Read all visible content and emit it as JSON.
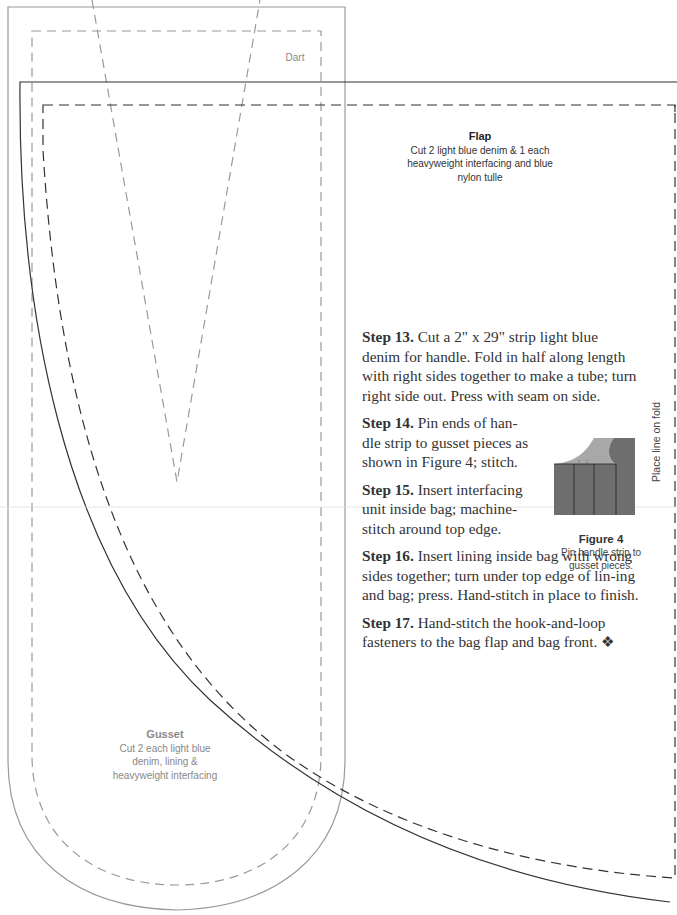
{
  "pattern": {
    "dart": {
      "label": "Dart"
    },
    "flap": {
      "title": "Flap",
      "instructions": [
        "Cut 2 light blue denim & 1 each",
        "heavyweight interfacing and blue",
        "nylon tulle"
      ]
    },
    "gusset": {
      "title": "Gusset",
      "instructions": [
        "Cut 2 each light blue",
        "denim, lining &",
        "heavyweight interfacing"
      ]
    },
    "fold_line": {
      "label": "Place line on fold"
    }
  },
  "steps": [
    {
      "label": "Step 13.",
      "text": " Cut a 2\" x 29\" strip light blue denim for handle. Fold in half along length with right sides together to make a tube; turn right side out. Press with seam on side."
    },
    {
      "label": "Step 14.",
      "text": " Pin ends of han-dle strip to gusset pieces as shown in Figure 4; stitch."
    },
    {
      "label": "Step 15.",
      "text": " Insert interfacing unit inside bag; machine-stitch around top edge."
    },
    {
      "label": "Step 16.",
      "text": " Insert lining inside bag with wrong sides together; turn under top edge of lin-ing and bag; press. Hand-stitch in place to finish."
    },
    {
      "label": "Step 17.",
      "text": " Hand-stitch the hook-and-loop fasteners to the bag flap and bag front. ❖"
    }
  ],
  "figure": {
    "title": "Figure 4",
    "caption_lines": [
      "Pin handle strip to",
      "gusset pieces."
    ],
    "colors": {
      "gusset": "#6e6e6e",
      "handle": "#a8a8a8"
    }
  },
  "colors": {
    "gusset_line": "#9a9a9a",
    "flap_line": "#3a3a3a",
    "text": "#333333"
  }
}
